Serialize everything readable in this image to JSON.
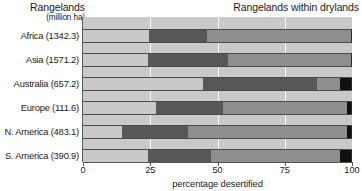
{
  "header": {
    "title_left_main": "Rangelands",
    "title_left_sub": "(million ha)",
    "title_right": "Rangelands within drylands"
  },
  "axis": {
    "xlabel": "percentage desertified",
    "ticks": [
      {
        "value": 0,
        "label": "0"
      },
      {
        "value": 25,
        "label": "25"
      },
      {
        "value": 50,
        "label": "50"
      },
      {
        "value": 75,
        "label": "75"
      },
      {
        "value": 100,
        "label": "100"
      }
    ]
  },
  "colors": {
    "light_gray": "#c9c9c9",
    "dark_gray": "#575757",
    "mid_gray": "#8e8e8e",
    "black": "#101010",
    "background": "#ffffff",
    "gridline": "#ffffff",
    "border": "#4a4a4a"
  },
  "chart_data": {
    "type": "bar",
    "orientation": "horizontal",
    "stacked": true,
    "title": "Rangelands within drylands",
    "xlabel": "percentage desertified",
    "ylabel": "Rangelands (million ha)",
    "xlim": [
      0,
      100
    ],
    "grid": true,
    "legend": "none",
    "categories": [
      "Africa (1342.3)",
      "Asia (1571.2)",
      "Australia (657.2)",
      "Europe (111.6)",
      "N. America (483.1)",
      "S. America (390.9)"
    ],
    "region_areas_million_ha": [
      1342.3,
      1571.2,
      657.2,
      111.6,
      483.1,
      390.9
    ],
    "series": [
      {
        "name": "light-gray-segment",
        "color": "#c9c9c9",
        "values": [
          24.5,
          24.0,
          44.5,
          27.0,
          14.5,
          24.0
        ]
      },
      {
        "name": "dark-gray-segment",
        "color": "#575757",
        "values": [
          21.5,
          30.0,
          42.5,
          25.0,
          24.5,
          23.5
        ]
      },
      {
        "name": "mid-gray-segment",
        "color": "#8e8e8e",
        "values": [
          54.0,
          46.0,
          8.5,
          46.0,
          59.0,
          48.2
        ]
      },
      {
        "name": "black-segment",
        "color": "#101010",
        "values": [
          0.0,
          0.0,
          4.5,
          2.0,
          2.0,
          4.3
        ]
      }
    ]
  }
}
